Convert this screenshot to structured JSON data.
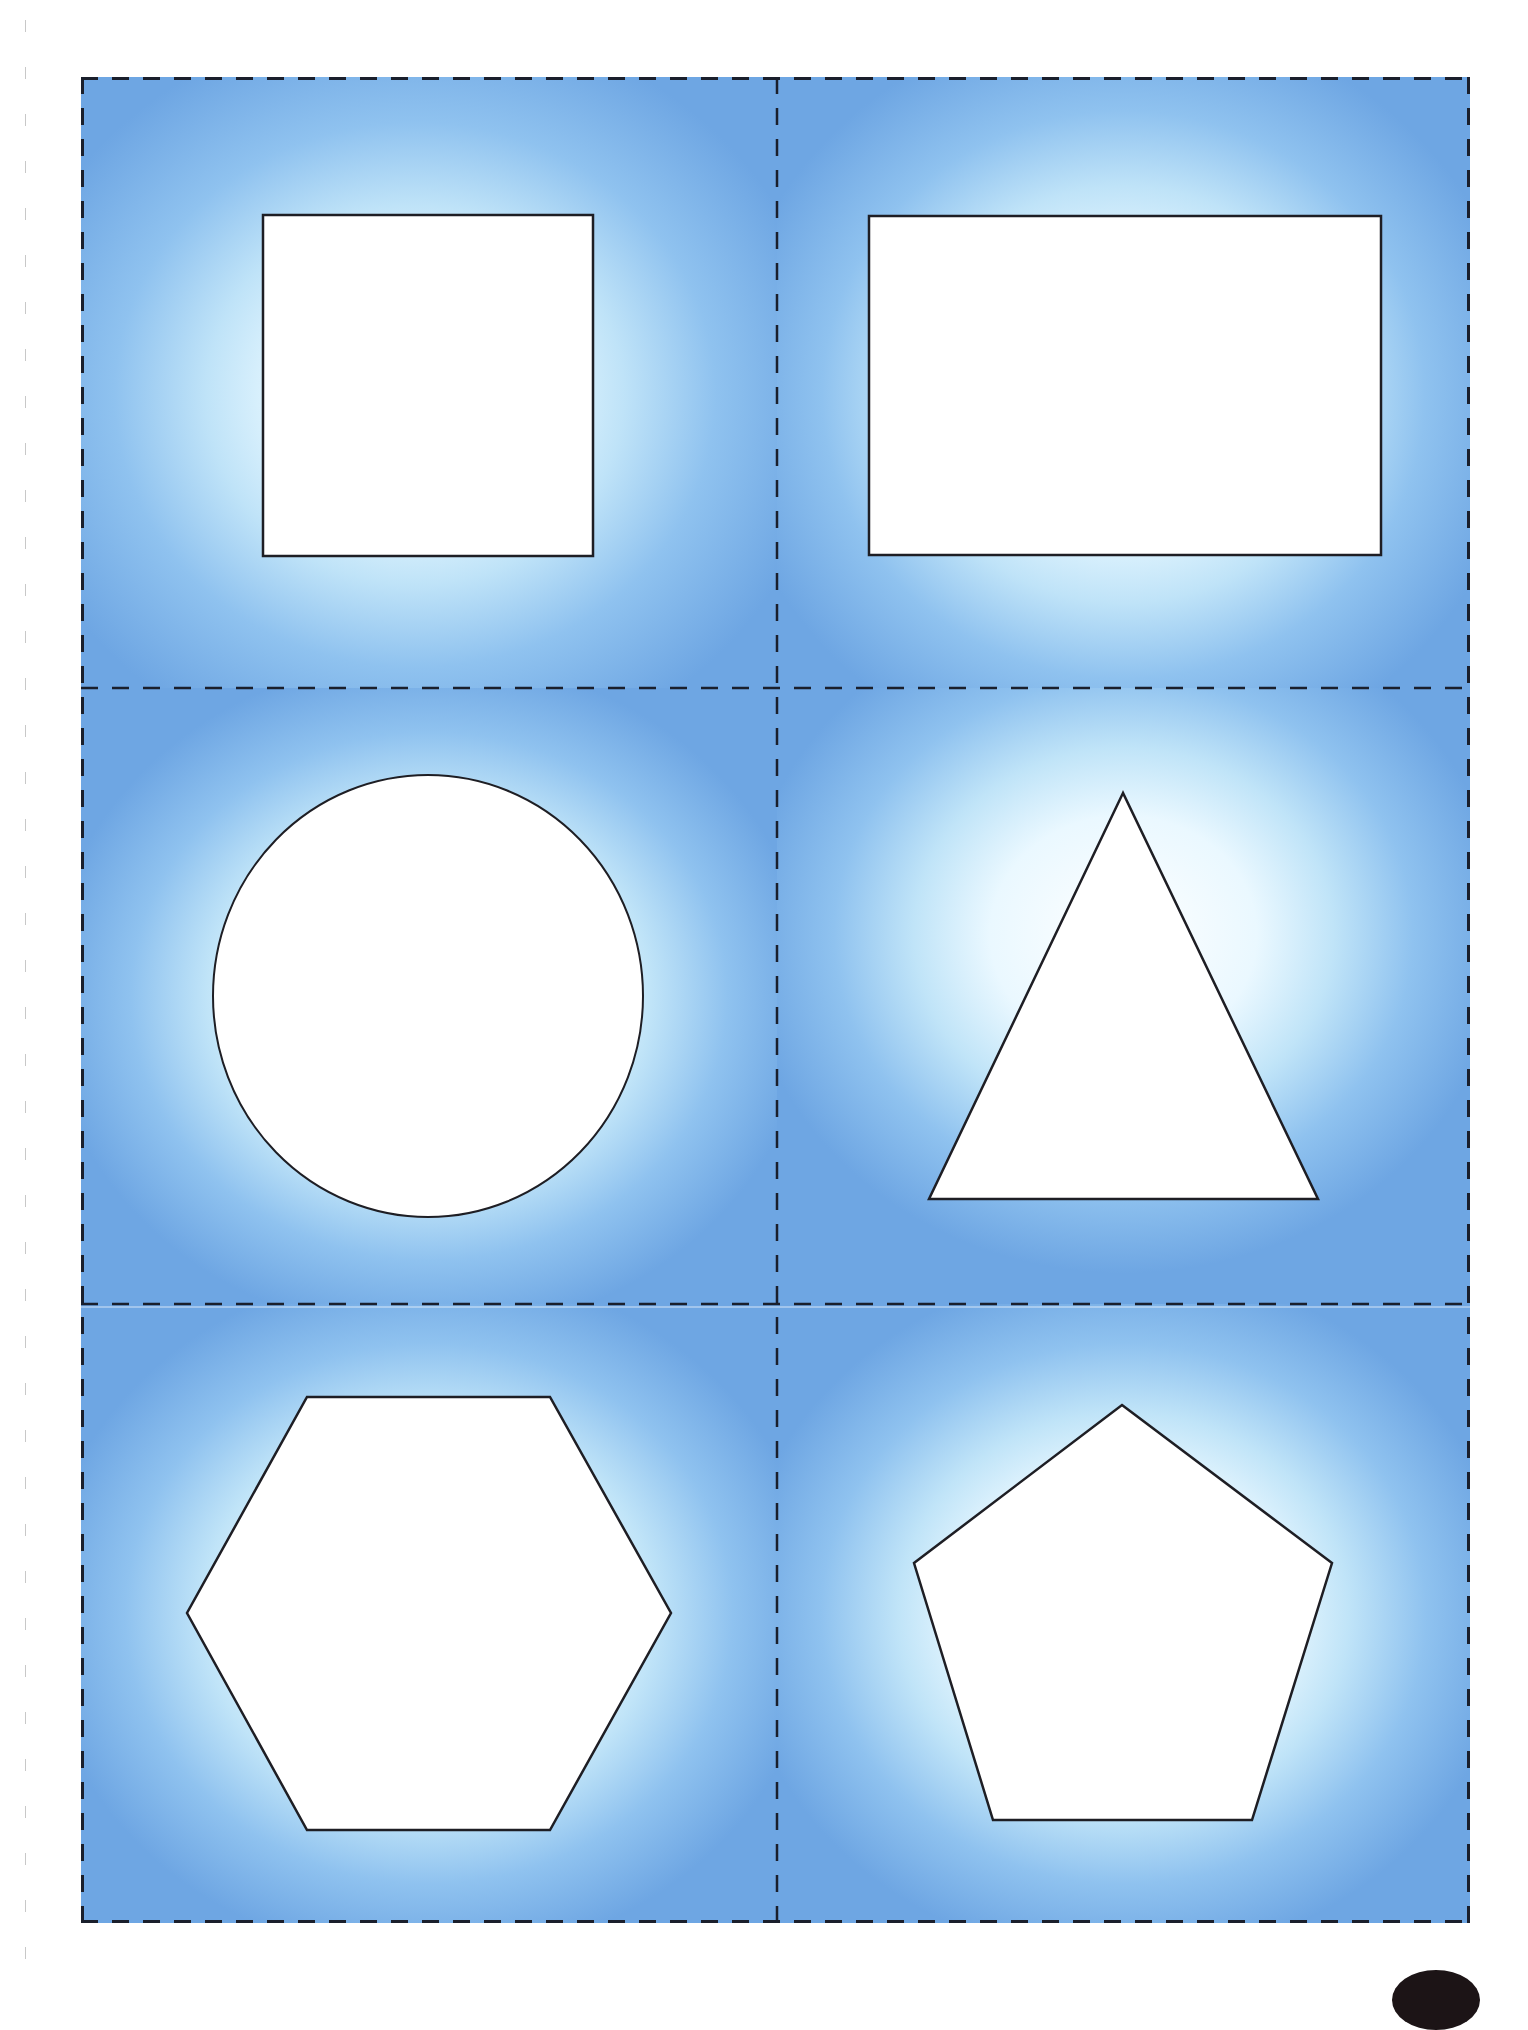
{
  "document": {
    "type": "printable shape cut-out cards",
    "layout": {
      "columns": 2,
      "rows": 3
    },
    "colors": {
      "card_edge": "#6ea6e3",
      "card_mid": "#a9d3f4",
      "card_center": "#f2fbff",
      "shape_fill": "#ffffff",
      "shape_stroke": "#1e1e24",
      "cut_line": "#1a1f2c",
      "margin_tick": "#c8c8c8",
      "corner_mark": "#1c1416"
    },
    "cards": [
      {
        "id": "square",
        "shape": "square-icon",
        "position": "top-left"
      },
      {
        "id": "rectangle",
        "shape": "rectangle-icon",
        "position": "top-right"
      },
      {
        "id": "circle",
        "shape": "circle-icon",
        "position": "middle-left"
      },
      {
        "id": "triangle",
        "shape": "triangle-icon",
        "position": "middle-right"
      },
      {
        "id": "hexagon",
        "shape": "hexagon-icon",
        "position": "bottom-left"
      },
      {
        "id": "pentagon",
        "shape": "pentagon-icon",
        "position": "bottom-right"
      }
    ],
    "cut_lines": {
      "style": "dashed",
      "orientation": [
        "vertical",
        "horizontal"
      ]
    }
  }
}
